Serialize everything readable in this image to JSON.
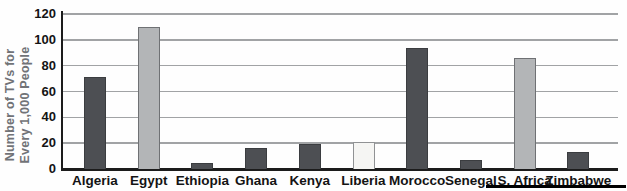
{
  "chart_data": {
    "type": "bar",
    "title": "",
    "ylabel_lines": [
      "Number of TVs for",
      "Every 1,000 People"
    ],
    "xlabel": "",
    "categories": [
      "Algeria",
      "Egypt",
      "Ethiopia",
      "Ghana",
      "Kenya",
      "Liberia",
      "Morocco",
      "Senegal",
      "S. Africa",
      "Zimbabwe"
    ],
    "values": [
      71,
      110,
      5,
      16,
      19,
      21,
      94,
      7,
      86,
      13
    ],
    "bar_styles": [
      "dark",
      "light",
      "dark",
      "dark",
      "dark",
      "white",
      "dark",
      "dark",
      "light",
      "dark"
    ],
    "yticks": [
      0,
      20,
      40,
      60,
      80,
      100,
      120
    ],
    "ylim": [
      0,
      120
    ],
    "grid": true,
    "legend": "none",
    "colors": {
      "dark": "#4d4f53",
      "light": "#b3b5b7",
      "white": "#f5f5f3",
      "bar_border_dark": "#3b3d40",
      "bar_border_light": "#6f7174",
      "bar_border_white": "#909294",
      "gridline": "#a1a3a5",
      "axis": "#1c1c1c",
      "tick_text": "#141414",
      "ylabel_text": "#717377",
      "bottom_rule": "#000000"
    }
  }
}
